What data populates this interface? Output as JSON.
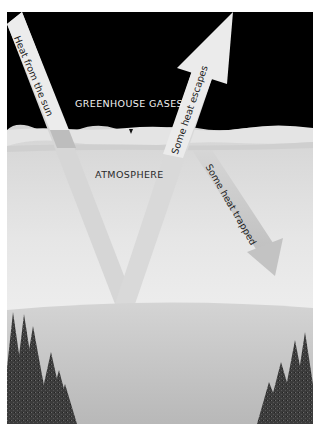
{
  "diagram": {
    "labels": {
      "sky": "GREENHOUSE GASES",
      "atmosphere": "ATMOSPHERE",
      "incoming": "Heat from the sun",
      "escaping": "Some heat escapes",
      "trapped": "Some heat trapped"
    },
    "colors": {
      "page_background": "#ffffff",
      "sky": "#000000",
      "greenhouse_layer": "#e2e2e2",
      "atmosphere_top": "#c4c4c4",
      "atmosphere_bottom": "#f7f7f7",
      "ground": "#bdbdbd",
      "beam": "#d9d9d9",
      "beam_light": "#ececec",
      "trees": "#3a3a3a"
    }
  }
}
